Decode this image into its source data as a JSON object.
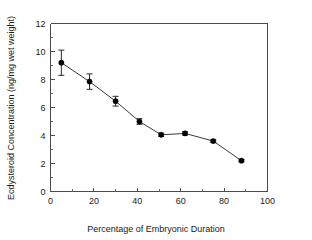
{
  "chart_data": {
    "type": "line",
    "title": "",
    "subtitle": "",
    "xlabel": "Percentage of Embryonic Duration",
    "ylabel": "Ecdysteroid Concentration (ng/mg wet weight)",
    "xlim": [
      0,
      100
    ],
    "ylim": [
      0,
      12
    ],
    "xticks": [
      0,
      20,
      40,
      60,
      80,
      100
    ],
    "xtick_labels": [
      "0",
      "20",
      "40",
      "60",
      "80",
      "100"
    ],
    "xminor_step": 10,
    "yticks": [
      0,
      2,
      4,
      6,
      8,
      10,
      12
    ],
    "ytick_labels": [
      "0",
      "2",
      "4",
      "6",
      "8",
      "10",
      "12"
    ],
    "yminor_step": 1,
    "grid": false,
    "legend": null,
    "legend_position": "none",
    "marker_style": "filled-circle",
    "marker_color": "#000000",
    "line_color": "#3a3a3a",
    "errorbar_color": "#2a2a2a",
    "x": [
      5,
      18,
      30,
      41,
      51,
      62,
      75,
      88
    ],
    "series": [
      {
        "name": "Ecdysteroid concentration",
        "values": [
          9.2,
          7.85,
          6.45,
          5.0,
          4.05,
          4.15,
          3.6,
          2.2
        ],
        "yerr": [
          0.9,
          0.55,
          0.35,
          0.2,
          0.12,
          0.12,
          0.1,
          0.08
        ]
      }
    ],
    "points": [
      {
        "x": 5,
        "y": 9.2,
        "err": 0.9
      },
      {
        "x": 18,
        "y": 7.85,
        "err": 0.55
      },
      {
        "x": 30,
        "y": 6.45,
        "err": 0.35
      },
      {
        "x": 41,
        "y": 5.0,
        "err": 0.2
      },
      {
        "x": 51,
        "y": 4.05,
        "err": 0.12
      },
      {
        "x": 62,
        "y": 4.15,
        "err": 0.12
      },
      {
        "x": 75,
        "y": 3.6,
        "err": 0.1
      },
      {
        "x": 88,
        "y": 2.2,
        "err": 0.08
      }
    ]
  }
}
